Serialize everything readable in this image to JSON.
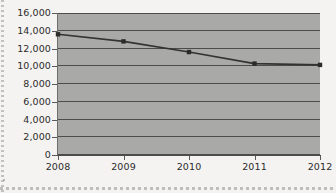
{
  "chart_data": {
    "type": "line",
    "title": "",
    "subtitle": "",
    "xlabel": "",
    "ylabel": "",
    "categories": [
      "2008",
      "2009",
      "2010",
      "2011",
      "2012"
    ],
    "values": [
      13600,
      12800,
      11600,
      10300,
      10150
    ],
    "series": [
      {
        "name": "",
        "values": [
          13600,
          12800,
          11600,
          10300,
          10150
        ]
      }
    ],
    "ylim": [
      0,
      16000
    ],
    "ytick_values": [
      0,
      2000,
      4000,
      6000,
      8000,
      10000,
      12000,
      14000,
      16000
    ],
    "ytick_labels": [
      "0",
      "2,000",
      "4,000",
      "6,000",
      "8,000",
      "10,000",
      "12,000",
      "14,000",
      "16,000"
    ],
    "xtick_labels": [
      "2008",
      "2009",
      "2010",
      "2011",
      "2012"
    ],
    "grid": "horizontal",
    "legend": "none",
    "marker": "square",
    "colors": {
      "plot_background": "#a9a9a7",
      "page_background": "#f4f3f1",
      "gridline": "#4c4c4c",
      "series_line": "#333333",
      "marker_fill": "#2b2b2b",
      "tick_label": "#2b2b2b"
    }
  }
}
